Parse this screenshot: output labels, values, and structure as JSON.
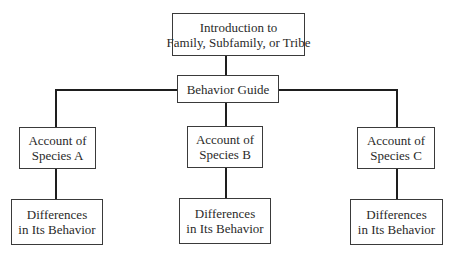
{
  "diagram": {
    "title_box": {
      "line1": "Introduction to",
      "line2": "Family, Subfamily, or Tribe"
    },
    "guide_box": {
      "label": "Behavior Guide"
    },
    "species": [
      {
        "account_line1": "Account of",
        "account_line2": "Species A",
        "diff_line1": "Differences",
        "diff_line2": "in Its Behavior"
      },
      {
        "account_line1": "Account of",
        "account_line2": "Species B",
        "diff_line1": "Differences",
        "diff_line2": "in Its Behavior"
      },
      {
        "account_line1": "Account of",
        "account_line2": "Species C",
        "diff_line1": "Differences",
        "diff_line2": "in Its Behavior"
      }
    ],
    "colors": {
      "line": "#1e1e1e",
      "border": "#3a3a3a",
      "text": "#2a2a2a",
      "background": "#ffffff"
    }
  }
}
